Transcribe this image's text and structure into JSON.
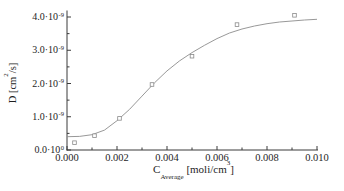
{
  "figure": {
    "background": "#ffffff",
    "kind": "scientific-plot"
  },
  "chart_data": {
    "type": "scatter",
    "title": "",
    "xlabel": {
      "symbol": "C",
      "subscript": "Average",
      "unit_pre": " [moli/cm",
      "unit_sup": "3",
      "unit_post": "]"
    },
    "ylabel": {
      "pre": "D [cm",
      "sup": "2",
      "post": "/s]"
    },
    "xlim": [
      0,
      0.01
    ],
    "ylim": [
      0,
      4.2e-09
    ],
    "grid": false,
    "legend": "none",
    "x_ticks": [
      {
        "value": 0.0,
        "label": "0.000"
      },
      {
        "value": 0.002,
        "label": "0.002"
      },
      {
        "value": 0.004,
        "label": "0.004"
      },
      {
        "value": 0.006,
        "label": "0.006"
      },
      {
        "value": 0.008,
        "label": "0.008"
      },
      {
        "value": 0.01,
        "label": "0.010"
      }
    ],
    "x_minor_ticks": [
      0.001,
      0.003,
      0.005,
      0.007,
      0.009
    ],
    "y_ticks": [
      {
        "value": 0,
        "mantissa": "0.0·10",
        "exponent": "0"
      },
      {
        "value": 1e-09,
        "mantissa": "1.0·10",
        "exponent": "-9"
      },
      {
        "value": 2e-09,
        "mantissa": "2.0·10",
        "exponent": "-9"
      },
      {
        "value": 3e-09,
        "mantissa": "3.0·10",
        "exponent": "-9"
      },
      {
        "value": 4e-09,
        "mantissa": "4.0·10",
        "exponent": "-9"
      }
    ],
    "y_minor_ticks": [
      5e-10,
      1.5e-09,
      2.5e-09,
      3.5e-09
    ],
    "series": [
      {
        "name": "measured-points",
        "type": "scatter",
        "marker": "open-square",
        "points": [
          [
            0.0003,
            2.2e-10
          ],
          [
            0.0011,
            4.3e-10
          ],
          [
            0.0021,
            9.5e-10
          ],
          [
            0.0034,
            1.97e-09
          ],
          [
            0.005,
            2.82e-09
          ],
          [
            0.0068,
            3.77e-09
          ],
          [
            0.0091,
            4.05e-09
          ]
        ]
      },
      {
        "name": "fit-curve",
        "type": "line",
        "points": [
          [
            0.0,
            4e-10
          ],
          [
            0.0005,
            4.1e-10
          ],
          [
            0.001,
            4.6e-10
          ],
          [
            0.0015,
            6e-10
          ],
          [
            0.002,
            8.8e-10
          ],
          [
            0.0025,
            1.22e-09
          ],
          [
            0.003,
            1.62e-09
          ],
          [
            0.0035,
            2.02e-09
          ],
          [
            0.004,
            2.38e-09
          ],
          [
            0.0045,
            2.68e-09
          ],
          [
            0.005,
            2.93e-09
          ],
          [
            0.0055,
            3.15e-09
          ],
          [
            0.006,
            3.35e-09
          ],
          [
            0.0065,
            3.52e-09
          ],
          [
            0.007,
            3.64e-09
          ],
          [
            0.0075,
            3.73e-09
          ],
          [
            0.008,
            3.8e-09
          ],
          [
            0.0085,
            3.85e-09
          ],
          [
            0.009,
            3.88e-09
          ],
          [
            0.0095,
            3.91e-09
          ],
          [
            0.01,
            3.93e-09
          ]
        ]
      }
    ],
    "colors": {
      "axis": "#3a3a3a",
      "text": "#1e1e1e",
      "curve": "#8c8c8c",
      "marker_stroke": "#8a8a8a",
      "marker_fill": "#ffffff"
    }
  }
}
